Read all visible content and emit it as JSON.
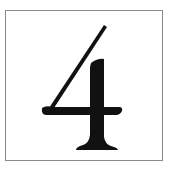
{
  "card": {
    "digit": "4",
    "border_color": "#8a8a8a",
    "ink_color": "#111111"
  }
}
